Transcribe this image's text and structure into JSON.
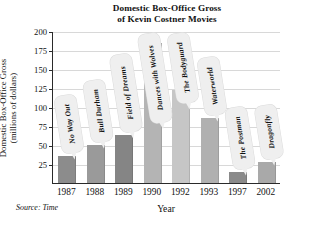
{
  "chart_data": {
    "type": "bar",
    "title": "Domestic Box-Office Gross of Kevin Costner Movies",
    "title_line1": "Domestic Box-Office Gross",
    "title_line2": "of Kevin Costner Movies",
    "xlabel": "Year",
    "ylabel": "Domestic Box-Office Gross",
    "ylabel_line1": "Domestic Box-Office Gross",
    "ylabel_line2": "(millions of dollars)",
    "ylim": [
      0,
      200
    ],
    "ytick_labels": [
      "200",
      "175",
      "150",
      "125",
      "100",
      "75",
      "50",
      "25"
    ],
    "yticks": [
      200,
      175,
      150,
      125,
      100,
      75,
      50,
      25
    ],
    "grid": true,
    "legend": "none",
    "categories": [
      "1987",
      "1988",
      "1989",
      "1990",
      "1992",
      "1993",
      "1997",
      "2002"
    ],
    "values": [
      35,
      50,
      63,
      184,
      122,
      85,
      15,
      27
    ],
    "annotations": [
      "No Way Out",
      "Bull Durham",
      "Field of Dreams",
      "Dances with Wolves",
      "The Bodyguard",
      "Waterworld",
      "The Postman",
      "Dragonfly"
    ],
    "bar_colors": [
      "#8c8c8c",
      "#9a9a9a",
      "#858585",
      "#b4b4b4",
      "#c6c6c6",
      "#b0b0b0",
      "#8a8a8a",
      "#a9a9a9"
    ],
    "source": "Source: Time",
    "bars": [
      {
        "year": "1987",
        "movie": "No Way Out",
        "gross": 35,
        "color": "#8c8c8c"
      },
      {
        "year": "1988",
        "movie": "Bull Durham",
        "gross": 50,
        "color": "#9a9a9a"
      },
      {
        "year": "1989",
        "movie": "Field of Dreams",
        "gross": 63,
        "color": "#858585"
      },
      {
        "year": "1990",
        "movie": "Dances with Wolves",
        "gross": 184,
        "color": "#b4b4b4"
      },
      {
        "year": "1992",
        "movie": "The Bodyguard",
        "gross": 122,
        "color": "#c6c6c6"
      },
      {
        "year": "1993",
        "movie": "Waterworld",
        "gross": 85,
        "color": "#b0b0b0"
      },
      {
        "year": "1997",
        "movie": "The Postman",
        "gross": 15,
        "color": "#8a8a8a"
      },
      {
        "year": "2002",
        "movie": "Dragonfly",
        "gross": 27,
        "color": "#a9a9a9"
      }
    ]
  }
}
